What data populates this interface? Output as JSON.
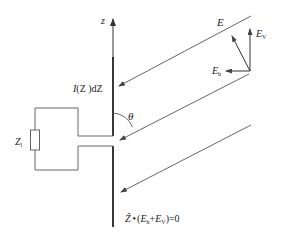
{
  "diagram": {
    "type": "antenna-field-geometry",
    "axis": {
      "label": "z"
    },
    "current_element": {
      "label_I": "I",
      "label_rest": "(Z )dZ"
    },
    "angle": {
      "label": "θ"
    },
    "load": {
      "label_main": "Z",
      "label_sub": "l"
    },
    "field": {
      "E_label": "E",
      "Ev_main": "E",
      "Ev_sub": "V",
      "Eh_main": "E",
      "Eh_sub": "h"
    },
    "equation": {
      "hat_Z": "Ẑ",
      "dot": "•",
      "open": "(",
      "Eh_main": "E",
      "Eh_sub": "h",
      "plus": "+",
      "Ev_main": "E",
      "Ev_sub": "V",
      "close": ")=0"
    },
    "rays": [
      {
        "from": [
          251,
          16
        ],
        "to": [
          118,
          87
        ]
      },
      {
        "from": [
          249,
          74
        ],
        "to": [
          119,
          141
        ]
      },
      {
        "from": [
          251,
          125
        ],
        "to": [
          120,
          193
        ]
      }
    ],
    "colors": {
      "line": "#555555",
      "antenna": "#222222",
      "text": "#222222",
      "background": "#ffffff"
    }
  }
}
